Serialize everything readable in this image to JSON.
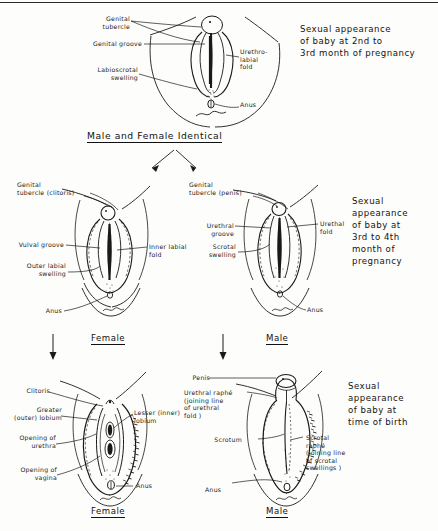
{
  "figure": {
    "type": "anatomical-development-diagram",
    "stage_header": "Male and Female Identical"
  },
  "stages": [
    {
      "id": "stage-1",
      "caption": "Sexual appearance\nof baby at 2nd to\n3rd month of pregnancy",
      "caption_lines": [
        "Sexual appearance",
        "of baby at 2nd to",
        "3rd month of pregnancy"
      ],
      "header": "Male and Female Identical",
      "panels": [
        {
          "id": "panel-indifferent",
          "sex_label": "",
          "labels": [
            "Genital\ntubercle",
            "Genital groove",
            "Labioscrotal\nswelling",
            "Urethro-\nlabial\nfold",
            "Anus"
          ]
        }
      ]
    },
    {
      "id": "stage-2",
      "caption": "Sexual\nappearance\nof baby at\n3rd to 4th\nmonth of\npregnancy",
      "caption_lines": [
        "Sexual",
        "appearance",
        "of baby at",
        "3rd to 4th",
        "month of",
        "pregnancy"
      ],
      "panels": [
        {
          "id": "panel-female-mid",
          "sex_label": "Female",
          "labels": [
            "Genital\ntubercle (clitoris)",
            "Vulval groove",
            "Outer labial\nswelling",
            "Inner labial\nfold",
            "Anus"
          ]
        },
        {
          "id": "panel-male-mid",
          "sex_label": "Male",
          "labels": [
            "Genital\ntubercle (penis)",
            "Urethral\ngroove",
            "Scrotal\nswelling",
            "Urethal\nfold",
            "Anus"
          ]
        }
      ]
    },
    {
      "id": "stage-3",
      "caption": "Sexual\nappearance\nof baby at\ntime of birth",
      "caption_lines": [
        "Sexual",
        "appearance",
        "of baby at",
        "time of birth"
      ],
      "panels": [
        {
          "id": "panel-female-birth",
          "sex_label": "Female",
          "labels": [
            "Clitoris",
            "Greater\n(outer) lobium",
            "Opening of\nurethra",
            "Opening of\nvagina",
            "Lesser (inner)\nlobium",
            "Anus"
          ]
        },
        {
          "id": "panel-male-birth",
          "sex_label": "Male",
          "labels": [
            "Penis",
            "Urethral raphé\n(joining line\nof urethral\nfold )",
            "Scrotum",
            "Scrotal\nraphé\n(joining line\nof scrotal\nswellings )",
            "Anus"
          ]
        }
      ]
    }
  ],
  "labels": {
    "s1_genital_tubercle": "Genital\ntubercle",
    "s1_genital_groove": "Genital groove",
    "s1_labioscrotal_swelling": "Labioscrotal\nswelling",
    "s1_urethro_labial_fold": "Urethro-\nlabial\nfold",
    "s1_anus": "Anus",
    "s2f_genital_tubercle": "Genital\ntubercle (clitoris)",
    "s2f_vulval_groove": "Vulval groove",
    "s2f_outer_labial_swelling": "Outer labial\nswelling",
    "s2f_inner_labial_fold": "Inner labial\nfold",
    "s2f_anus": "Anus",
    "s2m_genital_tubercle": "Genital\ntubercle (penis)",
    "s2m_urethral_groove": "Urethral\ngroove",
    "s2m_scrotal_swelling": "Scrotal\nswelling",
    "s2m_urethal_fold": "Urethal\nfold",
    "s2m_anus": "Anus",
    "s3f_clitoris": "Clitoris",
    "s3f_greater_lobium": "Greater\n(outer) lobium",
    "s3f_opening_urethra": "Opening of\nurethra",
    "s3f_opening_vagina": "Opening of\nvagina",
    "s3f_lesser_lobium": "Lesser (inner)\nlobium",
    "s3f_anus": "Anus",
    "s3m_penis": "Penis",
    "s3m_urethral_raphe": "Urethral raphé\n(joining line\nof urethral\nfold )",
    "s3m_scrotum": "Scrotum",
    "s3m_scrotal_raphe": "Scrotal\nraphé\n(joining line\nof scrotal\nswellings )",
    "s3m_anus": "Anus"
  },
  "sex_labels": {
    "female_mid": "Female",
    "male_mid": "Male",
    "female_birth": "Female",
    "male_birth": "Male"
  },
  "captions": {
    "stage1_l1": "Sexual appearance",
    "stage1_l2": "of baby at 2nd to",
    "stage1_l3": "3rd month of pregnancy",
    "stage2_l1": "Sexual",
    "stage2_l2": "appearance",
    "stage2_l3": "of baby at",
    "stage2_l4": "3rd to 4th",
    "stage2_l5": "month of",
    "stage2_l6": "pregnancy",
    "stage3_l1": "Sexual",
    "stage3_l2": "appearance",
    "stage3_l3": "of baby at",
    "stage3_l4": "time of birth"
  },
  "colors": {
    "ink": "#1a1a1a",
    "paper": "#fdfdfb"
  }
}
